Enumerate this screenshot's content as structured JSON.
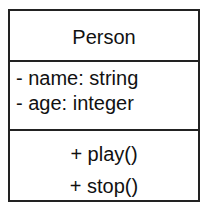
{
  "class": {
    "name": "Person",
    "attributes": [
      "- name: string",
      "- age: integer"
    ],
    "operations": [
      "+ play()",
      "+ stop()"
    ]
  },
  "colors": {
    "border": "#222222",
    "text": "#111111",
    "background": "#ffffff"
  }
}
